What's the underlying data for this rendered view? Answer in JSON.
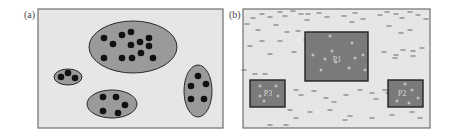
{
  "panels": [
    {
      "label": "(a)",
      "type": "clusters",
      "bounds": {
        "x": 38,
        "y": 9,
        "w": 185,
        "h": 119
      },
      "background": "#e6e6e6",
      "region_fill": "#9a9a9a",
      "point_color": "#111111",
      "clusters": [
        {
          "cx": 133,
          "cy": 47,
          "rx": 44,
          "ry": 26,
          "points": [
            [
              104,
              38
            ],
            [
              113,
              44
            ],
            [
              122,
              35
            ],
            [
              131,
              32
            ],
            [
              131,
              45
            ],
            [
              140,
              42
            ],
            [
              149,
              38
            ],
            [
              149,
              46
            ],
            [
              104,
              58
            ],
            [
              122,
              58
            ],
            [
              132,
              58
            ],
            [
              141,
              53
            ],
            [
              153,
              58
            ]
          ]
        },
        {
          "cx": 68,
          "cy": 77,
          "rx": 14,
          "ry": 8,
          "points": [
            [
              61,
              77
            ],
            [
              68,
              73
            ],
            [
              75,
              78
            ]
          ]
        },
        {
          "cx": 112,
          "cy": 104,
          "rx": 25,
          "ry": 14,
          "points": [
            [
              103,
              97
            ],
            [
              116,
              97
            ],
            [
              125,
              105
            ],
            [
              103,
              111
            ],
            [
              118,
              113
            ]
          ]
        },
        {
          "cx": 198,
          "cy": 91,
          "rx": 14,
          "ry": 26,
          "points": [
            [
              198,
              76
            ],
            [
              191,
              86
            ],
            [
              206,
              84
            ],
            [
              191,
              99
            ],
            [
              204,
              99
            ]
          ]
        }
      ]
    },
    {
      "label": "(b)",
      "type": "regions",
      "bounds": {
        "x": 243,
        "y": 9,
        "w": 187,
        "h": 119
      },
      "background": "#e6e6e6",
      "region_fill": "#7a7a7a",
      "regions": [
        {
          "name": "P1",
          "x": 305,
          "y": 32,
          "w": 63,
          "h": 49,
          "label_pos": [
            337,
            62
          ],
          "points": [
            [
              330,
              36
            ],
            [
              352,
              43
            ],
            [
              313,
              55
            ],
            [
              332,
              51
            ],
            [
              325,
              59
            ],
            [
              336,
              62
            ],
            [
              355,
              58
            ],
            [
              363,
              55
            ],
            [
              321,
              70
            ],
            [
              349,
              68
            ],
            [
              365,
              70
            ]
          ]
        },
        {
          "name": "P3",
          "x": 250,
          "y": 80,
          "w": 35,
          "h": 27,
          "label_pos": [
            268,
            96
          ],
          "points": [
            [
              260,
              86
            ],
            [
              276,
              86
            ],
            [
              260,
              96
            ],
            [
              278,
              96
            ],
            [
              264,
              101
            ]
          ]
        },
        {
          "name": "P2",
          "x": 388,
          "y": 80,
          "w": 35,
          "h": 27,
          "label_pos": [
            402,
            96
          ],
          "points": [
            [
              405,
              84
            ],
            [
              412,
              90
            ],
            [
              418,
              98
            ],
            [
              397,
              101
            ],
            [
              409,
              103
            ]
          ]
        }
      ],
      "noise_color": "#666666",
      "noise": [
        [
          253,
          18
        ],
        [
          262,
          14
        ],
        [
          270,
          17
        ],
        [
          280,
          12
        ],
        [
          285,
          16
        ],
        [
          293,
          11
        ],
        [
          301,
          14
        ],
        [
          307,
          20
        ],
        [
          319,
          13
        ],
        [
          327,
          17
        ],
        [
          344,
          16
        ],
        [
          352,
          22
        ],
        [
          355,
          13
        ],
        [
          363,
          19
        ],
        [
          380,
          15
        ],
        [
          387,
          12
        ],
        [
          396,
          14
        ],
        [
          402,
          18
        ],
        [
          410,
          12
        ],
        [
          418,
          15
        ],
        [
          426,
          19
        ],
        [
          247,
          24
        ],
        [
          258,
          30
        ],
        [
          276,
          25
        ],
        [
          287,
          32
        ],
        [
          298,
          31
        ],
        [
          306,
          40
        ],
        [
          308,
          14
        ],
        [
          250,
          46
        ],
        [
          262,
          41
        ],
        [
          280,
          41
        ],
        [
          294,
          52
        ],
        [
          270,
          54
        ],
        [
          389,
          26
        ],
        [
          401,
          33
        ],
        [
          410,
          30
        ],
        [
          384,
          52
        ],
        [
          396,
          55
        ],
        [
          403,
          50
        ],
        [
          413,
          51
        ],
        [
          422,
          48
        ],
        [
          395,
          58
        ],
        [
          413,
          56
        ],
        [
          255,
          74
        ],
        [
          265,
          74
        ],
        [
          244,
          70
        ],
        [
          296,
          90
        ],
        [
          301,
          95
        ],
        [
          314,
          91
        ],
        [
          326,
          98
        ],
        [
          334,
          102
        ],
        [
          346,
          95
        ],
        [
          372,
          93
        ],
        [
          385,
          90
        ],
        [
          360,
          90
        ],
        [
          388,
          93
        ],
        [
          376,
          99
        ],
        [
          290,
          110
        ],
        [
          310,
          112
        ],
        [
          330,
          110
        ],
        [
          350,
          116
        ],
        [
          372,
          118
        ],
        [
          392,
          115
        ],
        [
          412,
          112
        ],
        [
          420,
          118
        ],
        [
          296,
          118
        ],
        [
          270,
          125
        ],
        [
          286,
          125
        ],
        [
          345,
          120
        ]
      ]
    }
  ]
}
